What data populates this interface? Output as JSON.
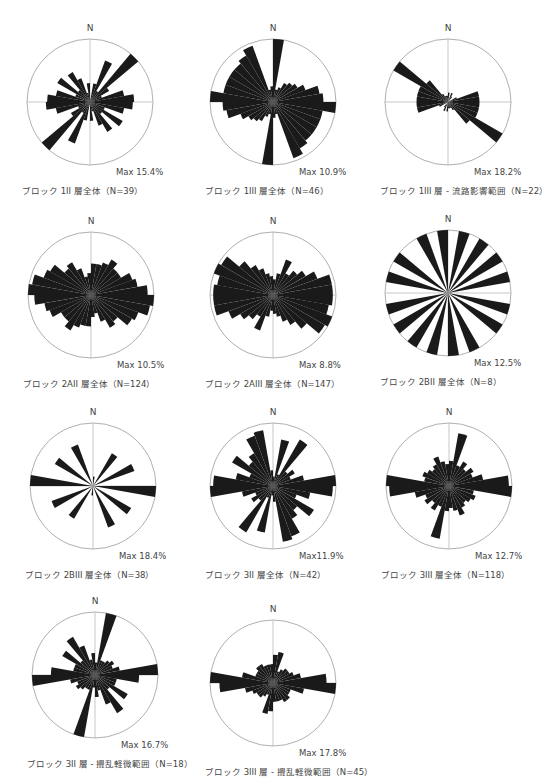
{
  "header": {
    "text": ""
  },
  "chart_data": [
    {
      "type": "rose",
      "title": "ブロック 1II 層全体（N=39）",
      "n_label": "N",
      "max_label": "Max 15.4%",
      "max_pct": 15.4,
      "n": 39,
      "bin_deg": 10,
      "values_0_180": [
        0.05,
        0.3,
        0.7,
        0.2,
        1.0,
        0.35,
        0.2,
        0.55,
        0.7,
        0.68,
        0.55,
        0.25,
        0.6,
        0.25,
        0.55,
        0.4,
        0.15,
        0.3
      ]
    },
    {
      "type": "rose",
      "title": "ブロック 1III 層全体（N=46）",
      "n_label": "N",
      "max_label": "Max 10.9%",
      "max_pct": 10.9,
      "n": 46,
      "bin_deg": 10,
      "values_0_180": [
        1.0,
        0.2,
        0.25,
        0.35,
        0.4,
        0.45,
        0.55,
        0.75,
        0.8,
        1.0,
        0.8,
        0.8,
        0.8,
        0.8,
        0.85,
        0.95,
        0.2,
        0.25
      ]
    },
    {
      "type": "rose",
      "title": "ブロック 1III 層 - 流路影響範囲（N=22）",
      "n_label": "N",
      "max_label": "Max 18.2%",
      "max_pct": 18.2,
      "n": 22,
      "bin_deg": 10,
      "values_0_180": [
        0.15,
        0.0,
        0.15,
        0.1,
        0.0,
        0.0,
        0.15,
        0.5,
        0.5,
        0.5,
        0.5,
        0.5,
        1.0,
        0.45,
        0.15,
        0.1,
        0.1,
        0.1
      ]
    },
    {
      "type": "rose",
      "title": "ブロック 2AII 層全体（N=124）",
      "n_label": "N",
      "max_label": "Max 10.5%",
      "max_pct": 10.5,
      "n": 124,
      "bin_deg": 10,
      "values_0_180": [
        0.5,
        0.5,
        0.55,
        0.65,
        0.55,
        0.55,
        0.7,
        0.75,
        0.9,
        1.0,
        0.95,
        0.8,
        0.75,
        0.55,
        0.6,
        0.45,
        0.3,
        0.35
      ]
    },
    {
      "type": "rose",
      "title": "ブロック 2AIII 層全体（N=147）",
      "n_label": "N",
      "max_label": "Max 8.8%",
      "max_pct": 8.8,
      "n": 147,
      "bin_deg": 10,
      "values_0_180": [
        0.25,
        0.35,
        0.6,
        0.4,
        0.5,
        0.6,
        0.75,
        0.95,
        0.95,
        0.95,
        0.9,
        1.0,
        0.95,
        0.7,
        0.55,
        0.45,
        0.35,
        0.3
      ]
    },
    {
      "type": "rose",
      "title": "ブロック 2BII 層全体（N=8）",
      "n_label": "N",
      "max_label": "Max 12.5%",
      "max_pct": 12.5,
      "n": 8,
      "bin_deg": 10,
      "values_0_180": [
        0,
        1,
        0,
        1,
        0,
        1,
        0,
        1,
        0,
        0,
        1,
        0,
        1,
        0,
        0,
        1,
        0,
        1
      ]
    },
    {
      "type": "rose",
      "title": "ブロック 2BIII 層全体（N=38）",
      "n_label": "N",
      "max_label": "Max 18.4%",
      "max_pct": 18.4,
      "n": 38,
      "bin_deg": 10,
      "values_0_180": [
        0.15,
        0.0,
        0.0,
        0.6,
        0.0,
        0.0,
        0.7,
        0.0,
        0.0,
        1.0,
        0.0,
        0.0,
        0.7,
        0.0,
        0.0,
        0.7,
        0.0,
        0.0
      ]
    },
    {
      "type": "rose",
      "title": "ブロック 3II 層全体（N=42）",
      "n_label": "N",
      "max_label": "Max11.9%",
      "max_pct": 11.9,
      "n": 42,
      "bin_deg": 10,
      "values_0_180": [
        0.15,
        0.75,
        0.2,
        0.85,
        0.3,
        0.4,
        0.3,
        0.5,
        1.0,
        0.95,
        0.6,
        0.4,
        0.75,
        0.5,
        0.6,
        0.85,
        0.9,
        0.25
      ]
    },
    {
      "type": "rose",
      "title": "ブロック 3III 層全体（N=118）",
      "n_label": "N",
      "max_label": "Max 12.7%",
      "max_pct": 12.7,
      "n": 118,
      "bin_deg": 10,
      "values_0_180": [
        0.4,
        0.85,
        0.35,
        0.45,
        0.35,
        0.45,
        0.4,
        0.55,
        0.95,
        1.0,
        0.4,
        0.45,
        0.4,
        0.35,
        0.4,
        0.5,
        0.4,
        0.35
      ]
    },
    {
      "type": "rose",
      "title": "ブロック 3II 層 - 攪乱軽微範囲（N=18）",
      "n_label": "N",
      "max_label": "Max 16.7%",
      "max_pct": 16.7,
      "n": 18,
      "bin_deg": 10,
      "values_0_180": [
        0.2,
        1.0,
        0.25,
        0.25,
        0.3,
        0.35,
        0.3,
        0.4,
        1.0,
        0.7,
        0.35,
        0.35,
        0.6,
        0.3,
        0.7,
        0.5,
        0.25,
        0.35
      ]
    },
    {
      "type": "rose",
      "title": "ブロック 3III 層 - 攪乱軽微範囲（N=45）",
      "n_label": "N",
      "max_label": "Max 17.8%",
      "max_pct": 17.8,
      "n": 45,
      "bin_deg": 10,
      "values_0_180": [
        0.45,
        0.5,
        0.2,
        0.25,
        0.3,
        0.3,
        0.35,
        0.45,
        0.85,
        1.0,
        0.5,
        0.3,
        0.3,
        0.35,
        0.35,
        0.3,
        0.3,
        0.3
      ]
    }
  ],
  "layout": {
    "panels": [
      {
        "cx": 90,
        "cy": 102,
        "r": 63
      },
      {
        "cx": 273,
        "cy": 102,
        "r": 63
      },
      {
        "cx": 448,
        "cy": 102,
        "r": 63
      },
      {
        "cx": 91,
        "cy": 295,
        "r": 63
      },
      {
        "cx": 273,
        "cy": 295,
        "r": 63
      },
      {
        "cx": 448,
        "cy": 293,
        "r": 63
      },
      {
        "cx": 93,
        "cy": 486,
        "r": 63
      },
      {
        "cx": 273,
        "cy": 486,
        "r": 63
      },
      {
        "cx": 449,
        "cy": 486,
        "r": 63
      },
      {
        "cx": 95,
        "cy": 675,
        "r": 63
      },
      {
        "cx": 273,
        "cy": 683,
        "r": 63
      }
    ]
  },
  "colors": {
    "fill": "#1a1a1a",
    "circle": "#9a9a9a",
    "axis": "#b0b0b0"
  }
}
